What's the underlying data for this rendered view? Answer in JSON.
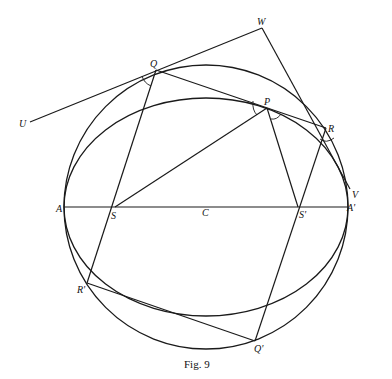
{
  "figure": {
    "caption": "Fig. 9",
    "points": {
      "W": "W",
      "Q": "Q",
      "P": "P",
      "R": "R",
      "U": "U",
      "V": "V",
      "A": "A",
      "S": "S",
      "C": "C",
      "S_prime": "S'",
      "A_prime": "A'",
      "R_prime": "R'",
      "Q_prime": "Q'"
    }
  }
}
